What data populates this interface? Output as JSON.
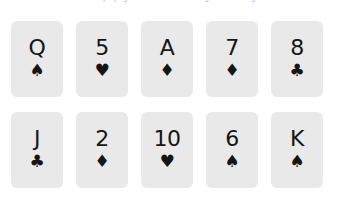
{
  "caption": {
    "text": "a row of playing cards on a white background making a mistake"
  },
  "board": {
    "suit_glyphs": {
      "spades": "♠",
      "hearts": "♥",
      "diamonds": "♦",
      "clubs": "♣"
    },
    "card_color": "#e9e9e9",
    "ink_color": "#151515",
    "background_color": "#ffffff",
    "rows": [
      {
        "cards": [
          {
            "rank": "Q",
            "suit": "spades",
            "suit_glyph": "♠",
            "name": "queen-of-spades"
          },
          {
            "rank": "5",
            "suit": "hearts",
            "suit_glyph": "♥",
            "name": "five-of-hearts"
          },
          {
            "rank": "A",
            "suit": "diamonds",
            "suit_glyph": "♦",
            "name": "ace-of-diamonds"
          },
          {
            "rank": "7",
            "suit": "diamonds",
            "suit_glyph": "♦",
            "name": "seven-of-diamonds"
          },
          {
            "rank": "8",
            "suit": "clubs",
            "suit_glyph": "♣",
            "name": "eight-of-clubs"
          }
        ]
      },
      {
        "cards": [
          {
            "rank": "J",
            "suit": "clubs",
            "suit_glyph": "♣",
            "name": "jack-of-clubs"
          },
          {
            "rank": "2",
            "suit": "diamonds",
            "suit_glyph": "♦",
            "name": "two-of-diamonds"
          },
          {
            "rank": "10",
            "suit": "hearts",
            "suit_glyph": "♥",
            "name": "ten-of-hearts"
          },
          {
            "rank": "6",
            "suit": "spades",
            "suit_glyph": "♠",
            "name": "six-of-spades"
          },
          {
            "rank": "K",
            "suit": "spades",
            "suit_glyph": "♠",
            "name": "king-of-spades"
          }
        ]
      }
    ]
  }
}
